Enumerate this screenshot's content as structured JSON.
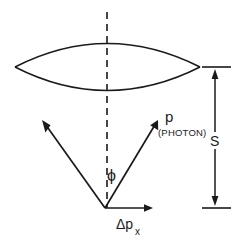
{
  "figure": {
    "background_color": "#ffffff",
    "ink_color": "#1a1a1a",
    "width": 235,
    "height": 246
  },
  "labels": {
    "photon_momentum": "p",
    "photon_qualifier": "(PHOTON)",
    "angle_phi": "ϕ",
    "distance_s": "S",
    "momentum_x_symbol": "Δp",
    "momentum_x_subscript": "x"
  },
  "elements": {
    "lens": {
      "name": "biconvex-lens",
      "left_tip": [
        15,
        67
      ],
      "right_tip": [
        200,
        67
      ],
      "top_apex": [
        107,
        33
      ],
      "bottom_apex": [
        107,
        101
      ]
    },
    "optical_axis": {
      "name": "optical-axis-dashed",
      "x": 107,
      "y_start": 12,
      "y_end": 208,
      "style": "dashed"
    },
    "left_ray": {
      "name": "left-cone-ray",
      "from": [
        105,
        208
      ],
      "to": [
        42,
        120
      ]
    },
    "right_ray": {
      "name": "photon-momentum-ray",
      "from": [
        105,
        208
      ],
      "to": [
        158,
        120
      ]
    },
    "momentum_x_arrow": {
      "name": "delta-px-arrow",
      "from": [
        105,
        208
      ],
      "to": [
        152,
        208
      ]
    },
    "distance_dimension": {
      "name": "s-dimension-arrow",
      "x": 215,
      "y_top": 67,
      "y_bottom": 208,
      "tick_x_start": 202,
      "tick_x_end": 231
    }
  },
  "label_positions": {
    "p": [
      168,
      120
    ],
    "photon": [
      160,
      133
    ],
    "phi": [
      112,
      178
    ],
    "s": [
      211,
      145
    ],
    "dpx": [
      120,
      228
    ],
    "dpx_sub": [
      136,
      233
    ]
  }
}
